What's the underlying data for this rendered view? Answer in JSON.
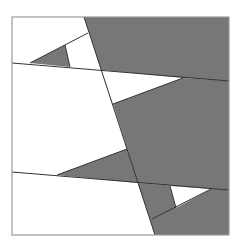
{
  "diagram": {
    "width": 241,
    "height": 245,
    "background": "#ffffff",
    "frame": {
      "x": 12,
      "y": 17,
      "width": 217,
      "height": 218,
      "stroke": "#9a9a9a"
    },
    "fill_color": "#777777",
    "line_color": "#333333",
    "gray_regions": [
      {
        "name": "top-right-region",
        "points": "84,17 229,17 229,81 183,78 101,70"
      },
      {
        "name": "top-left-small-triangle",
        "points": "30,63 65,45 70,67"
      },
      {
        "name": "middle-right-region",
        "points": "101,70 183,78 229,81 229,190 138,183 113,104"
      },
      {
        "name": "lower-left-triangle",
        "points": "57,175 127,149 138,183"
      },
      {
        "name": "bottom-right-region",
        "points": "138,183 229,190 229,235 155,235"
      }
    ],
    "white_regions": [
      {
        "name": "top-left-white-quad",
        "points": "65,45 88,33 101,70 70,67"
      },
      {
        "name": "middle-white-triangle",
        "points": "101,70 183,78 113,104"
      },
      {
        "name": "bottom-white-triangle",
        "points": "170,186 211,189 176,208"
      }
    ],
    "lines": [
      {
        "name": "main-diagonal",
        "x1": 84,
        "y1": 17,
        "x2": 155,
        "y2": 235
      },
      {
        "name": "upper-horizontal",
        "x1": 12,
        "y1": 63,
        "x2": 229,
        "y2": 81
      },
      {
        "name": "lower-horizontal",
        "x1": 12,
        "y1": 172,
        "x2": 229,
        "y2": 190
      },
      {
        "name": "top-short-slant",
        "x1": 30,
        "y1": 63,
        "x2": 88,
        "y2": 33
      },
      {
        "name": "top-short-vertical",
        "x1": 65,
        "y1": 45,
        "x2": 70,
        "y2": 67
      },
      {
        "name": "middle-slant",
        "x1": 113,
        "y1": 104,
        "x2": 183,
        "y2": 78
      },
      {
        "name": "lower-slant",
        "x1": 57,
        "y1": 175,
        "x2": 127,
        "y2": 149
      },
      {
        "name": "bottom-slant",
        "x1": 152,
        "y1": 219,
        "x2": 211,
        "y2": 189
      },
      {
        "name": "bottom-short-vertical",
        "x1": 170,
        "y1": 186,
        "x2": 176,
        "y2": 208
      }
    ]
  }
}
